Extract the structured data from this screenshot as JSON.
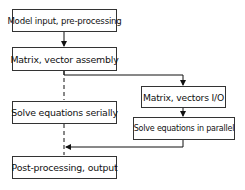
{
  "diagram": {
    "type": "flowchart",
    "nodes": [
      {
        "id": "n1",
        "label": "Model input, pre-processing"
      },
      {
        "id": "n2",
        "label": "Matrix, vector assembly"
      },
      {
        "id": "n3",
        "label": "Solve equations serially"
      },
      {
        "id": "n4",
        "label": "Matrix, vectors I/O"
      },
      {
        "id": "n5",
        "label": "Solve equations in parallel"
      },
      {
        "id": "n6",
        "label": "Post-processing, output"
      }
    ],
    "edges": [
      {
        "from": "n1",
        "to": "n2",
        "style": "solid"
      },
      {
        "from": "n2",
        "to": "n3",
        "style": "dashed"
      },
      {
        "from": "n3",
        "to": "n6",
        "style": "dashed"
      },
      {
        "from": "n2",
        "to": "n4",
        "style": "solid"
      },
      {
        "from": "n4",
        "to": "n5",
        "style": "solid"
      },
      {
        "from": "n5",
        "to": "n6",
        "style": "solid"
      }
    ]
  }
}
